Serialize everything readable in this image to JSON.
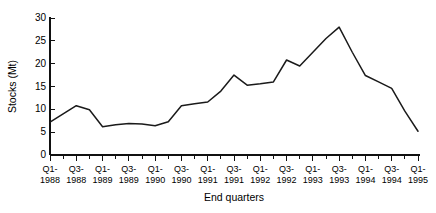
{
  "chart_data": {
    "type": "line",
    "title": "",
    "xlabel": "End quarters",
    "ylabel": "Stocks (Mt)",
    "ylim": [
      0,
      30
    ],
    "ytick_values": [
      0,
      5,
      10,
      15,
      20,
      25,
      30
    ],
    "ytick_labels": [
      "0",
      "5",
      "10",
      "15",
      "20",
      "25",
      "30"
    ],
    "grid": false,
    "legend": null,
    "legend_position": "none",
    "x": [
      "Q1-1988",
      "Q2-1988",
      "Q3-1988",
      "Q4-1988",
      "Q1-1989",
      "Q2-1989",
      "Q3-1989",
      "Q4-1989",
      "Q1-1990",
      "Q2-1990",
      "Q3-1990",
      "Q4-1990",
      "Q1-1991",
      "Q2-1991",
      "Q3-1991",
      "Q4-1991",
      "Q1-1992",
      "Q2-1992",
      "Q3-1992",
      "Q4-1992",
      "Q1-1993",
      "Q2-1993",
      "Q3-1993",
      "Q4-1993",
      "Q1-1994",
      "Q2-1994",
      "Q3-1994",
      "Q4-1994",
      "Q1-1995"
    ],
    "xtick_labels": [
      [
        "Q1-",
        "1988"
      ],
      [
        "Q3-",
        "1988"
      ],
      [
        "Q1-",
        "1989"
      ],
      [
        "Q3-",
        "1989"
      ],
      [
        "Q1-",
        "1990"
      ],
      [
        "Q3-",
        "1990"
      ],
      [
        "Q1-",
        "1991"
      ],
      [
        "Q3-",
        "1991"
      ],
      [
        "Q1-",
        "1992"
      ],
      [
        "Q3-",
        "1992"
      ],
      [
        "Q1-",
        "1993"
      ],
      [
        "Q3-",
        "1993"
      ],
      [
        "Q1-",
        "1994"
      ],
      [
        "Q3-",
        "1994"
      ],
      [
        "Q1-",
        "1995"
      ]
    ],
    "values": [
      7.2,
      9.0,
      10.8,
      9.9,
      6.2,
      6.6,
      6.9,
      6.8,
      6.4,
      7.3,
      10.8,
      11.2,
      11.6,
      14.0,
      17.5,
      15.3,
      15.6,
      16.0,
      20.8,
      19.5,
      22.5,
      25.5,
      28.0,
      22.5,
      17.4,
      16.0,
      14.6,
      9.6,
      5.2
    ],
    "series_name": "Stocks",
    "line_color": "#1a1a1a"
  },
  "layout": {
    "plot_left": 50,
    "plot_right": 418,
    "plot_top": 18,
    "plot_bottom": 155
  }
}
